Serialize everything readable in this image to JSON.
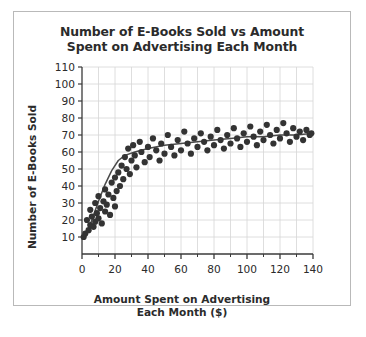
{
  "figure": {
    "title": "Number of E-Books Sold vs Amount\nSpent on Advertising Each Month",
    "title_line1": "Number of E-Books Sold vs Amount",
    "title_line2": "Spent on Advertising Each Month",
    "border_color": "#b9b9b9",
    "background": "#ffffff"
  },
  "chart_data": {
    "type": "scatter",
    "title": "Number of E-Books Sold vs Amount Spent on Advertising Each Month",
    "xlabel": "Amount Spent on Advertising Each Month ($)",
    "xlabel_line1": "Amount Spent on Advertising",
    "xlabel_line2": "Each Month ($)",
    "ylabel": "Number of E-Books Sold",
    "xlim": [
      0,
      140
    ],
    "ylim": [
      0,
      110
    ],
    "x_ticks_major": [
      0,
      20,
      40,
      60,
      80,
      100,
      120,
      140
    ],
    "x_ticks_minor": [
      10,
      30,
      50,
      70,
      90,
      110,
      130
    ],
    "x_tick_labels": [
      "0",
      "20",
      "40",
      "60",
      "80",
      "100",
      "120",
      "140"
    ],
    "y_ticks": [
      10,
      20,
      30,
      40,
      50,
      60,
      70,
      80,
      90,
      100,
      110
    ],
    "y_tick_labels": [
      "10",
      "20",
      "30",
      "40",
      "50",
      "60",
      "70",
      "80",
      "90",
      "100",
      "110"
    ],
    "grid": true,
    "grid_color": "#d6d6d6",
    "legend": null,
    "marker_color": "#333333",
    "marker_size": 3.1,
    "series": [
      {
        "name": "E-Books sold per month",
        "points": [
          [
            1,
            10
          ],
          [
            2,
            12
          ],
          [
            3,
            20
          ],
          [
            4,
            14
          ],
          [
            5,
            17
          ],
          [
            5,
            26
          ],
          [
            6,
            22
          ],
          [
            7,
            16
          ],
          [
            8,
            19
          ],
          [
            8,
            30
          ],
          [
            9,
            24
          ],
          [
            10,
            21
          ],
          [
            10,
            34
          ],
          [
            11,
            27
          ],
          [
            12,
            18
          ],
          [
            13,
            31
          ],
          [
            14,
            25
          ],
          [
            14,
            38
          ],
          [
            15,
            29
          ],
          [
            16,
            35
          ],
          [
            17,
            23
          ],
          [
            18,
            42
          ],
          [
            19,
            33
          ],
          [
            20,
            28
          ],
          [
            20,
            45
          ],
          [
            21,
            37
          ],
          [
            22,
            48
          ],
          [
            23,
            40
          ],
          [
            24,
            52
          ],
          [
            25,
            44
          ],
          [
            26,
            57
          ],
          [
            27,
            50
          ],
          [
            28,
            62
          ],
          [
            29,
            47
          ],
          [
            30,
            55
          ],
          [
            31,
            64
          ],
          [
            32,
            58
          ],
          [
            33,
            51
          ],
          [
            35,
            66
          ],
          [
            36,
            60
          ],
          [
            38,
            54
          ],
          [
            40,
            63
          ],
          [
            41,
            57
          ],
          [
            43,
            68
          ],
          [
            45,
            61
          ],
          [
            47,
            55
          ],
          [
            48,
            65
          ],
          [
            50,
            59
          ],
          [
            52,
            70
          ],
          [
            54,
            63
          ],
          [
            56,
            58
          ],
          [
            58,
            67
          ],
          [
            60,
            61
          ],
          [
            62,
            72
          ],
          [
            64,
            65
          ],
          [
            66,
            59
          ],
          [
            68,
            68
          ],
          [
            70,
            63
          ],
          [
            72,
            71
          ],
          [
            74,
            66
          ],
          [
            76,
            61
          ],
          [
            78,
            69
          ],
          [
            80,
            64
          ],
          [
            82,
            73
          ],
          [
            84,
            67
          ],
          [
            86,
            62
          ],
          [
            88,
            70
          ],
          [
            90,
            65
          ],
          [
            92,
            74
          ],
          [
            94,
            68
          ],
          [
            96,
            63
          ],
          [
            98,
            71
          ],
          [
            100,
            66
          ],
          [
            102,
            75
          ],
          [
            104,
            69
          ],
          [
            106,
            64
          ],
          [
            108,
            72
          ],
          [
            110,
            67
          ],
          [
            112,
            76
          ],
          [
            114,
            70
          ],
          [
            116,
            65
          ],
          [
            118,
            73
          ],
          [
            120,
            68
          ],
          [
            122,
            77
          ],
          [
            124,
            71
          ],
          [
            126,
            66
          ],
          [
            128,
            74
          ],
          [
            130,
            69
          ],
          [
            132,
            72
          ],
          [
            134,
            67
          ],
          [
            136,
            73
          ],
          [
            138,
            70
          ],
          [
            139,
            71
          ]
        ]
      }
    ],
    "trend_line": {
      "name": "fitted curve",
      "color": "#4a4a4a",
      "points": [
        [
          2,
          10
        ],
        [
          6,
          20
        ],
        [
          10,
          31
        ],
        [
          14,
          41
        ],
        [
          18,
          49
        ],
        [
          22,
          55
        ],
        [
          26,
          58
        ],
        [
          32,
          60
        ],
        [
          40,
          62
        ],
        [
          50,
          64
        ],
        [
          60,
          65
        ],
        [
          70,
          66
        ],
        [
          80,
          67
        ],
        [
          90,
          68
        ],
        [
          100,
          69
        ],
        [
          110,
          69
        ],
        [
          120,
          70
        ],
        [
          130,
          70
        ],
        [
          140,
          71
        ]
      ]
    }
  }
}
